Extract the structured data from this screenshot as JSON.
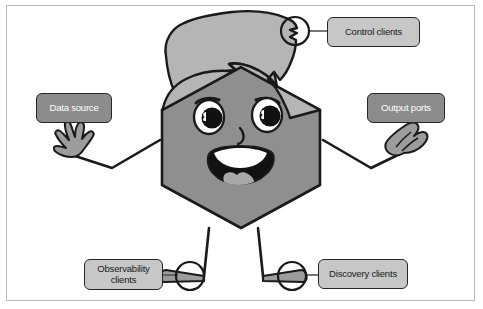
{
  "figure": {
    "background_color": "#ffffff",
    "frame_color": "#b9b9b9"
  },
  "palette": {
    "body_fill": "#8f8f8f",
    "hair_fill": "#b5b5b5",
    "outline": "#1a1a1a",
    "label_light_fill": "#c7c7c7",
    "label_dark_fill": "#8c8c8c",
    "label_light_text": "#1a1a1a",
    "label_dark_text": "#ffffff",
    "eye_white": "#ffffff",
    "pupil": "#111111",
    "mouth": "#111111",
    "tongue": "#a8a8a8"
  },
  "labels": [
    {
      "id": "control",
      "text": "Control clients",
      "style": "light",
      "position": "top-right"
    },
    {
      "id": "data_source",
      "text": "Data source",
      "style": "dark",
      "position": "left"
    },
    {
      "id": "output",
      "text": "Output ports",
      "style": "dark",
      "position": "right"
    },
    {
      "id": "observability",
      "text": "Observability\nclients",
      "style": "light",
      "position": "bottom-left"
    },
    {
      "id": "discovery",
      "text": "Discovery clients",
      "style": "light",
      "position": "bottom-right"
    }
  ],
  "mascot": {
    "body_shape": "hexagon",
    "features": [
      "hair",
      "eyes",
      "eyebrows",
      "nose",
      "smiling-mouth",
      "tongue",
      "arms",
      "hands",
      "legs",
      "feet"
    ]
  },
  "connectors": [
    {
      "from": "hair-tip-port",
      "to": "control",
      "has_circle": true
    },
    {
      "from": "left-foot-port",
      "to": "observability",
      "has_circle": true
    },
    {
      "from": "right-foot-port",
      "to": "discovery",
      "has_circle": true
    }
  ]
}
